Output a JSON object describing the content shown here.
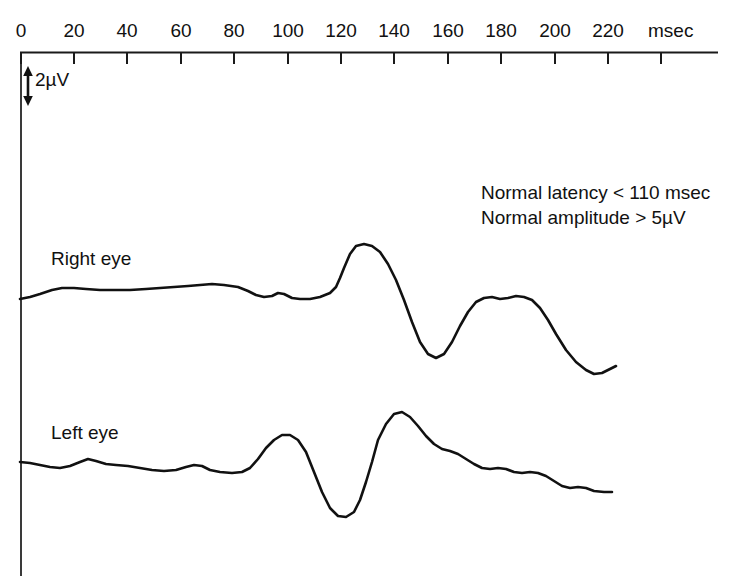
{
  "figure": {
    "type": "clinical-vep-waveform-chart",
    "background_color": "#ffffff",
    "trace_color": "#111111",
    "axis_color": "#1a1a1a"
  },
  "axis": {
    "unit_label": "msec",
    "tick_values": [
      0,
      20,
      40,
      60,
      80,
      100,
      120,
      140,
      160,
      180,
      200,
      220
    ],
    "tick_labels": [
      "0",
      "20",
      "40",
      "60",
      "80",
      "100",
      "120",
      "140",
      "160",
      "180",
      "200",
      "220"
    ],
    "x_min": 0,
    "x_max": 220,
    "grid": false,
    "orientation": "top-horizontal"
  },
  "scale_bar": {
    "label": "2µV",
    "value": 2,
    "unit": "µV",
    "icon": "double-arrow-vertical-icon"
  },
  "notes": {
    "latency": "Normal latency < 110 msec",
    "amplitude": "Normal amplitude > 5µV"
  },
  "traces": [
    {
      "id": "right-eye",
      "label": "Right eye",
      "baseline_y": 296,
      "path": "M 20 299 L 30 297 L 40 294 L 52 290 L 62 288 L 74 288 L 86 289 L 100 290 L 116 290 L 130 290 L 146 289 L 160 288 L 174 287 L 188 286 L 200 285 L 212 284 L 224 285 L 238 287 L 248 291 L 256 295 L 264 297 L 272 296 L 278 293 L 284 294 L 292 298 L 300 299 L 310 299 L 320 297 L 330 293 L 336 287 L 340 278 L 344 268 L 350 254 L 356 246 L 364 244 L 372 246 L 380 252 L 388 264 L 396 280 L 404 300 L 412 322 L 420 342 L 428 354 L 436 358 L 444 354 L 452 342 L 460 326 L 468 312 L 476 302 L 484 298 L 492 297 L 500 299 L 508 298 L 516 296 L 524 297 L 532 300 L 540 308 L 548 320 L 556 334 L 566 350 L 576 362 L 586 370 L 594 374 L 602 373 L 610 369 L 616 366"
    },
    {
      "id": "left-eye",
      "label": "Left eye",
      "baseline_y": 462,
      "path": "M 20 462 L 30 463 L 40 465 L 50 467 L 60 468 L 70 466 L 80 462 L 88 459 L 96 461 L 106 464 L 116 465 L 128 466 L 140 468 L 152 470 L 164 471 L 176 470 L 186 467 L 194 465 L 202 466 L 210 470 L 220 472 L 232 473 L 242 472 L 250 468 L 258 459 L 266 448 L 274 440 L 282 435 L 290 435 L 298 440 L 306 452 L 314 472 L 322 492 L 330 508 L 338 516 L 346 517 L 354 512 L 360 500 L 366 482 L 372 462 L 378 440 L 386 424 L 394 414 L 402 412 L 410 417 L 418 426 L 426 436 L 434 444 L 442 449 L 450 451 L 458 454 L 466 459 L 474 464 L 482 468 L 490 469 L 498 468 L 506 469 L 514 472 L 522 473 L 530 472 L 538 473 L 546 476 L 554 481 L 562 486 L 570 488 L 578 487 L 586 488 L 594 491 L 604 492 L 612 492"
    }
  ],
  "chart_data": {
    "type": "line",
    "title": "",
    "xlabel": "msec",
    "ylabel": "µV",
    "xlim": [
      0,
      220
    ],
    "grid": false,
    "legend": "inline-labels",
    "annotations": [
      "Normal latency < 110 msec",
      "Normal amplitude > 5µV",
      "2µV"
    ],
    "series": [
      {
        "name": "Right eye",
        "description": "VEP trace, broad positive P100-like peak near 125 msec followed by a deep negative trough near 155 msec and a secondary positive deflection near 180 msec",
        "x": [
          0,
          5,
          10,
          15,
          20,
          25,
          30,
          35,
          40,
          45,
          50,
          55,
          60,
          65,
          70,
          75,
          80,
          85,
          90,
          95,
          100,
          105,
          110,
          115,
          120,
          125,
          130,
          135,
          140,
          145,
          150,
          155,
          160,
          165,
          170,
          175,
          180,
          185,
          190,
          195,
          200,
          205,
          210,
          215,
          220
        ],
        "y": [
          0.0,
          0.1,
          0.2,
          0.3,
          0.3,
          0.3,
          0.3,
          0.3,
          0.4,
          0.4,
          0.4,
          0.5,
          0.5,
          0.5,
          0.4,
          0.2,
          0.1,
          0.2,
          0.3,
          0.1,
          0.0,
          0.0,
          0.1,
          0.4,
          1.0,
          1.9,
          2.0,
          1.7,
          1.0,
          0.0,
          -1.2,
          -2.2,
          -2.4,
          -1.9,
          -0.9,
          -0.1,
          0.1,
          0.1,
          0.0,
          -0.2,
          -0.9,
          -1.9,
          -2.7,
          -3.0,
          -2.8
        ]
      },
      {
        "name": "Left eye",
        "description": "VEP trace, early positive bump near 85 msec, deep negative trough near 115 msec, large positive peak near 140 msec, then slow decline to baseline",
        "x": [
          0,
          5,
          10,
          15,
          20,
          25,
          30,
          35,
          40,
          45,
          50,
          55,
          60,
          65,
          70,
          75,
          80,
          85,
          90,
          95,
          100,
          105,
          110,
          115,
          120,
          125,
          130,
          135,
          140,
          145,
          150,
          155,
          160,
          165,
          170,
          175,
          180,
          185,
          190,
          195,
          200,
          205,
          210,
          215,
          220
        ],
        "y": [
          0.0,
          -0.1,
          -0.2,
          -0.3,
          -0.2,
          0.0,
          0.1,
          0.0,
          -0.1,
          -0.2,
          -0.2,
          -0.3,
          -0.4,
          -0.3,
          -0.2,
          -0.2,
          -0.3,
          -0.4,
          -0.4,
          -0.2,
          0.3,
          0.9,
          1.0,
          0.4,
          -1.0,
          -2.0,
          -2.1,
          -1.5,
          0.3,
          1.6,
          1.9,
          1.5,
          0.9,
          0.5,
          0.3,
          0.1,
          -0.2,
          -0.3,
          -0.3,
          -0.4,
          -0.5,
          -0.7,
          -0.9,
          -1.0,
          -1.0
        ]
      }
    ]
  }
}
